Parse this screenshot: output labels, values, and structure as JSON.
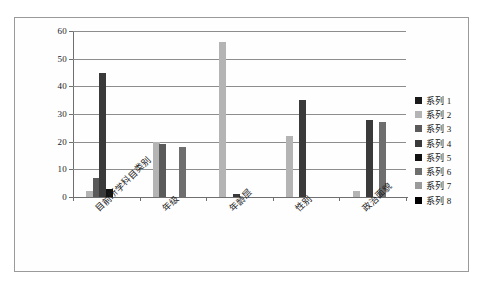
{
  "chart_data": {
    "type": "bar",
    "title": "",
    "subtitle": "",
    "xlabel": "",
    "ylabel": "",
    "ylim": [
      0,
      60
    ],
    "yticks": [
      "0",
      "10",
      "20",
      "30",
      "40",
      "50",
      "60"
    ],
    "grid": true,
    "legend_position": "right",
    "categories": [
      "目前所学科目类别",
      "年级",
      "年龄层",
      "性别",
      "政治面貌"
    ],
    "series": [
      {
        "name": "系列 1",
        "color": "#1a1a1a",
        "values": [
          0,
          0,
          0,
          0,
          0
        ]
      },
      {
        "name": "系列 2",
        "color": "#b4b4b4",
        "values": [
          2,
          20,
          56,
          22,
          2
        ]
      },
      {
        "name": "系列 3",
        "color": "#5a5a5a",
        "values": [
          7,
          19,
          0,
          0,
          0
        ]
      },
      {
        "name": "系列 4",
        "color": "#3a3a3a",
        "values": [
          45,
          0,
          1,
          35,
          28
        ]
      },
      {
        "name": "系列 5",
        "color": "#111111",
        "values": [
          3,
          0,
          0,
          0,
          0
        ]
      },
      {
        "name": "系列 6",
        "color": "#6e6e6e",
        "values": [
          0,
          18,
          0,
          0,
          27
        ]
      },
      {
        "name": "系列 7",
        "color": "#9a9a9a",
        "values": [
          0,
          0,
          0,
          0,
          0
        ]
      },
      {
        "name": "系列 8",
        "color": "#000000",
        "values": [
          0,
          0,
          0,
          0,
          0
        ]
      }
    ]
  }
}
